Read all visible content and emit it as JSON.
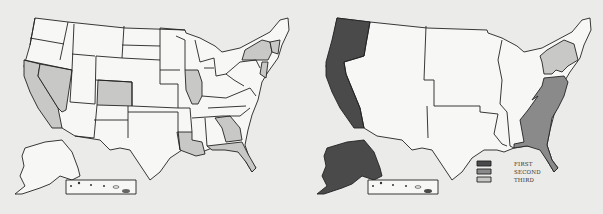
{
  "colors": {
    "background": "#ebebea",
    "unshaded": "#f7f7f5",
    "light_gray": "#c8c8c6",
    "first": "#4a4a4a",
    "second": "#8a8a8a",
    "third": "#c8c8c6",
    "border": "#222222"
  },
  "left_map": {
    "title": "",
    "shaded_states": [
      "California",
      "Nevada",
      "Colorado",
      "Illinois",
      "Louisiana",
      "Georgia",
      "Florida",
      "New York",
      "New Jersey",
      "Connecticut",
      "Massachusetts",
      "Rhode Island"
    ]
  },
  "right_map": {
    "regions": [
      {
        "name": "Pacific",
        "rank": "FIRST"
      },
      {
        "name": "South Atlantic",
        "rank": "SECOND"
      },
      {
        "name": "Middle Atlantic",
        "rank": "THIRD"
      }
    ]
  },
  "legend": {
    "items": [
      {
        "label": "FIRST",
        "color": "#4a4a4a"
      },
      {
        "label": "SECOND",
        "color": "#8a8a8a"
      },
      {
        "label": "THIRD",
        "color": "#c8c8c6"
      }
    ]
  }
}
